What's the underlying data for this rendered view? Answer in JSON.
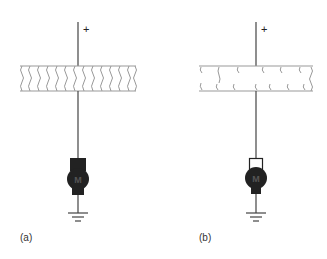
{
  "diagram": {
    "panels": [
      {
        "label": "(a)",
        "terminal_sign": "+",
        "band_style": "continuous-wavy",
        "motor_letter": "M",
        "motor_brush_style": "filled"
      },
      {
        "label": "(b)",
        "terminal_sign": "+",
        "band_style": "broken-wavy",
        "motor_letter": "M",
        "motor_brush_style": "outline"
      }
    ],
    "colors": {
      "line": "#444444",
      "band_border": "#999999",
      "motor_fill": "#222222",
      "background": "#ffffff"
    }
  }
}
